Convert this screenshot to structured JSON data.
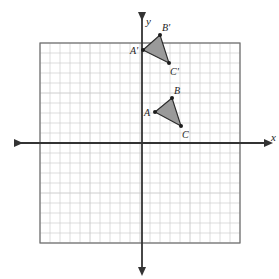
{
  "figure": {
    "kind": "coordinate-plane-with-triangles",
    "background_color": "#ffffff"
  },
  "axes": {
    "x_label": "x",
    "y_label": "y",
    "axis_color": "#333333",
    "origin_px": {
      "x": 142,
      "y": 143
    },
    "unit_px": 10,
    "x_axis_extent_px": {
      "from": 15,
      "to": 265
    },
    "y_axis_extent_px": {
      "from": 13,
      "to": 268
    }
  },
  "grid": {
    "cell_size_px": 10,
    "columns": 20,
    "rows": 20,
    "left_px": 40,
    "top_px": 43,
    "right_px": 240,
    "bottom_px": 243,
    "line_color": "#c8c8c8",
    "border_color": "#6e6e6e",
    "show": true
  },
  "shapes": {
    "fill_color": "#9a9a9a",
    "stroke_color": "#2b2b2b",
    "vertex_dot_color": "#1c1c1c",
    "triangles": [
      {
        "id": "triangle-abc",
        "name": "Triangle ABC",
        "vertices": [
          {
            "label": "A",
            "x": 1.3,
            "y": 3.1,
            "label_dx": -11,
            "label_dy": -4
          },
          {
            "label": "B",
            "x": 3.0,
            "y": 4.5,
            "label_dx": 2,
            "label_dy": -12
          },
          {
            "label": "C",
            "x": 3.9,
            "y": 1.7,
            "label_dx": 1,
            "label_dy": 4
          }
        ]
      },
      {
        "id": "triangle-a-prime-b-prime-c-prime",
        "name": "Triangle A'B'C'",
        "vertices": [
          {
            "label": "A'",
            "x": 0.1,
            "y": 9.3,
            "label_dx": -13,
            "label_dy": -4
          },
          {
            "label": "B'",
            "x": 1.8,
            "y": 10.8,
            "label_dx": 2,
            "label_dy": -12
          },
          {
            "label": "C'",
            "x": 2.7,
            "y": 8.0,
            "label_dx": 1,
            "label_dy": 4
          }
        ]
      }
    ]
  },
  "labels": {
    "x_axis": "x",
    "y_axis": "y",
    "A": "A",
    "B": "B",
    "C": "C",
    "A_prime": "A'",
    "B_prime": "B'",
    "C_prime": "C'"
  }
}
